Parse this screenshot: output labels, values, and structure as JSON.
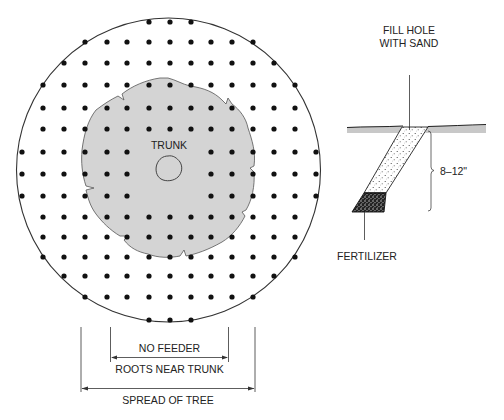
{
  "colors": {
    "ink": "#222222",
    "root_zone_gray": "#d4d4d4",
    "ground_gray": "#c8c8c8",
    "background": "#ffffff"
  },
  "plan_view": {
    "trunk_label": "TRUNK",
    "dot_grid": {
      "spacing_px": 21,
      "rows": [
        {
          "y": 22,
          "x_from": 149,
          "x_to": 191,
          "gaps": []
        },
        {
          "y": 42,
          "x_from": 85,
          "x_to": 253,
          "gaps": []
        },
        {
          "y": 63,
          "x_from": 64,
          "x_to": 274,
          "gaps": []
        },
        {
          "y": 85,
          "x_from": 43,
          "x_to": 295,
          "gaps": []
        },
        {
          "y": 108,
          "x_from": 43,
          "x_to": 295,
          "gaps": []
        },
        {
          "y": 129,
          "x_from": 43,
          "x_to": 295,
          "gaps": []
        },
        {
          "y": 152,
          "x_from": 22,
          "x_to": 316,
          "gaps": [
            149,
            170,
            191
          ]
        },
        {
          "y": 174,
          "x_from": 22,
          "x_to": 316,
          "gaps": [
            149,
            170,
            191
          ]
        },
        {
          "y": 196,
          "x_from": 22,
          "x_to": 316,
          "gaps": [
            149,
            170,
            191
          ]
        },
        {
          "y": 217,
          "x_from": 43,
          "x_to": 295,
          "gaps": []
        },
        {
          "y": 237,
          "x_from": 43,
          "x_to": 295,
          "gaps": []
        },
        {
          "y": 257,
          "x_from": 43,
          "x_to": 295,
          "gaps": []
        },
        {
          "y": 276,
          "x_from": 64,
          "x_to": 274,
          "gaps": []
        },
        {
          "y": 297,
          "x_from": 85,
          "x_to": 253,
          "gaps": []
        },
        {
          "y": 320,
          "x_from": 149,
          "x_to": 191,
          "gaps": []
        }
      ]
    },
    "dimensions": {
      "inner_label_top": "NO FEEDER",
      "inner_label_bottom": "ROOTS NEAR TRUNK",
      "outer_label": "SPREAD OF TREE"
    }
  },
  "section_view": {
    "fill_label_line1": "FILL HOLE",
    "fill_label_line2": "WITH SAND",
    "depth_label": "8–12\"",
    "fertilizer_label": "FERTILIZER"
  }
}
